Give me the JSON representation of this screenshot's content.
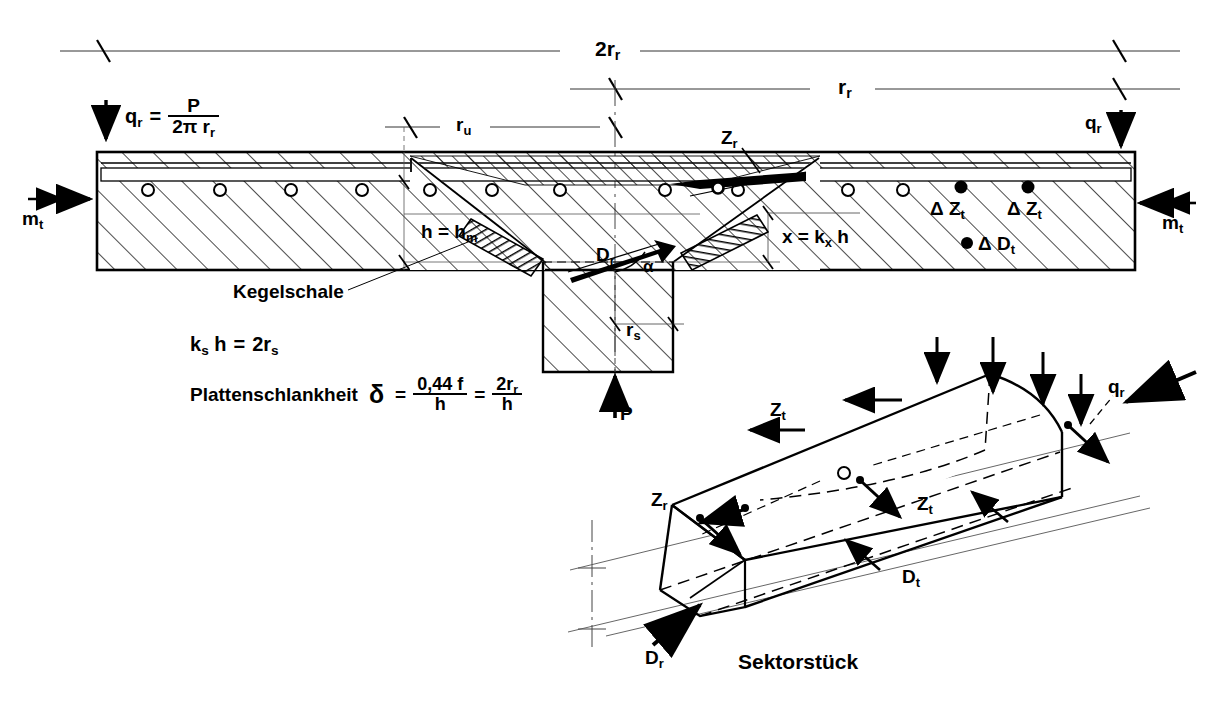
{
  "figure": {
    "caption": "Sektorstück"
  },
  "labels": {
    "dim_full_span": "2r",
    "dim_full_span_sub": "r",
    "dim_half_span": "r",
    "dim_half_span_sub": "r",
    "dim_ru": "r",
    "dim_ru_sub": "u",
    "dim_rs": "r",
    "dim_rs_sub": "s",
    "load_qr": "q",
    "load_qr_sub": "r",
    "load_qr_right": "q",
    "load_qr_right_sub": "r",
    "moment_mt_left": "m",
    "moment_mt_left_sub": "t",
    "moment_mt_right": "m",
    "moment_mt_right_sub": "t",
    "reaction_P": "P",
    "thickness_h": "h = h",
    "thickness_h_sub": "m",
    "neutral_axis": "x = k",
    "neutral_axis_sub": "x",
    "neutral_axis_tail": " h",
    "shell_name": "Kegelschale",
    "force_Zr_section": "Z",
    "force_Zr_section_sub": "r",
    "force_Dr_section": "D",
    "force_Dr_section_sub": "r",
    "angle_alpha": "α",
    "delta_Zt_1": "Δ Z",
    "delta_Zt_1_sub": "t",
    "delta_Zt_2": "Δ Z",
    "delta_Zt_2_sub": "t",
    "delta_Dt": "Δ D",
    "delta_Dt_sub": "t",
    "sector_Zt_top": "Z",
    "sector_Zt_top_sub": "t",
    "sector_Zr": "Z",
    "sector_Zr_sub": "r",
    "sector_Zt_mid": "Z",
    "sector_Zt_mid_sub": "t",
    "sector_Dt": "D",
    "sector_Dt_sub": "t",
    "sector_Dr": "D",
    "sector_Dr_sub": "r",
    "sector_qr": "q",
    "sector_qr_sub": "r",
    "sector_caption": "Sektorstück"
  },
  "equations": {
    "qr_definition": {
      "lhs": "q",
      "lhs_sub": "r",
      "eq": "=",
      "numerator": "P",
      "denominator": "2π r",
      "denominator_sub": "r"
    },
    "ks_relation": {
      "lhs": "k",
      "lhs_sub": "s",
      "lhs_tail": " h",
      "eq": "=",
      "rhs": "2r",
      "rhs_sub": "s"
    },
    "slenderness": {
      "name": "Plattenschlankheit",
      "symbol": "δ",
      "eq1": "=",
      "frac1_num": "0,44 f",
      "frac1_den": "h",
      "eq2": "=",
      "frac2_num": "2r",
      "frac2_num_sub": "r",
      "frac2_den": "h"
    }
  },
  "colors": {
    "ink": "#000000",
    "paper": "#ffffff",
    "hatch": "#1a1a1a",
    "thin": "#333333"
  }
}
